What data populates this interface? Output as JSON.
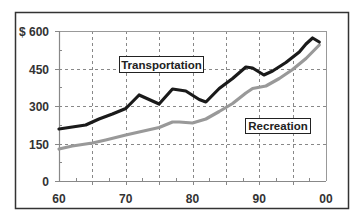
{
  "chart_data": {
    "type": "line",
    "title": "",
    "xlabel": "",
    "ylabel": "",
    "y_prefix": "$",
    "xlim": [
      60,
      100
    ],
    "ylim": [
      0,
      600
    ],
    "grid": true,
    "x_ticks": [
      60,
      70,
      80,
      90,
      100
    ],
    "x_tick_labels": [
      "60",
      "70",
      "80",
      "90",
      "00"
    ],
    "y_ticks": [
      0,
      150,
      300,
      450,
      600
    ],
    "y_tick_labels": [
      "0",
      "150",
      "300",
      "450",
      "$ 600"
    ],
    "legend_position": "inline labels",
    "series": [
      {
        "name": "Transportation",
        "color": "#1a1a1a",
        "x": [
          60,
          62,
          64,
          66,
          68,
          70,
          72,
          75,
          77,
          79,
          81,
          82,
          84,
          86,
          88,
          89,
          90.7,
          92,
          94,
          96,
          97,
          98,
          99
        ],
        "values": [
          208,
          216,
          224,
          248,
          268,
          290,
          344,
          308,
          368,
          360,
          326,
          316,
          370,
          410,
          456,
          452,
          424,
          440,
          474,
          516,
          548,
          572,
          556
        ]
      },
      {
        "name": "Recreation",
        "color": "#999999",
        "x": [
          60,
          62,
          65,
          67,
          70,
          72,
          75,
          77,
          78,
          80,
          82,
          84,
          86,
          88,
          89,
          91,
          93,
          95,
          97,
          99
        ],
        "values": [
          128,
          140,
          152,
          164,
          184,
          196,
          214,
          236,
          236,
          232,
          248,
          278,
          310,
          352,
          370,
          380,
          410,
          446,
          490,
          544
        ]
      }
    ]
  },
  "labels": {
    "transportation": "Transportation",
    "recreation": "Recreation"
  }
}
